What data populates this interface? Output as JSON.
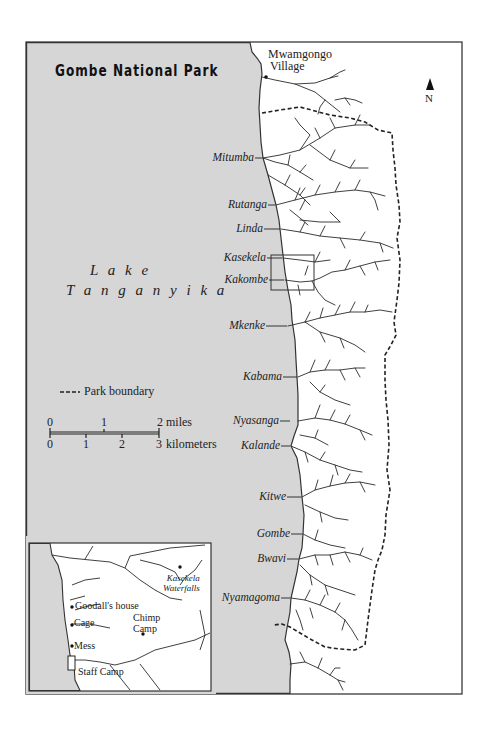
{
  "title": "Gombe National Park",
  "colors": {
    "lake": "#d6d6d6",
    "land": "#ffffff",
    "ink": "#222222",
    "frame": "#3a3a3a"
  },
  "north_arrow": {
    "icon": "north-arrow-icon",
    "label": "N"
  },
  "village": {
    "line1": "Mwamgongo",
    "line2": "Village"
  },
  "lake": {
    "line1": "L a k e",
    "line2": "T a n g a n y i k a"
  },
  "places": [
    {
      "name": "Mitumba",
      "y": 158
    },
    {
      "name": "Rutanga",
      "y": 205
    },
    {
      "name": "Linda",
      "y": 229
    },
    {
      "name": "Kasekela",
      "y": 258
    },
    {
      "name": "Kakombe",
      "y": 280
    },
    {
      "name": "Mkenke",
      "y": 326
    },
    {
      "name": "Kabama",
      "y": 377
    },
    {
      "name": "Nyasanga",
      "y": 421
    },
    {
      "name": "Kalande",
      "y": 446
    },
    {
      "name": "Kitwe",
      "y": 497
    },
    {
      "name": "Gombe",
      "y": 534
    },
    {
      "name": "Bwavi",
      "y": 559
    },
    {
      "name": "Nyamagoma",
      "y": 598
    }
  ],
  "legend": {
    "boundary_symbol": "---",
    "boundary_label": "Park boundary"
  },
  "scale": {
    "miles_ticks": [
      "0",
      "1",
      "2"
    ],
    "miles_unit": "miles",
    "km_ticks": [
      "0",
      "1",
      "2",
      "3"
    ],
    "km_unit": "kilometers"
  },
  "inset": {
    "goodall": "Goodall's house",
    "cage": "Cage",
    "mess": "Mess",
    "staff": "Staff Camp",
    "chimp1": "Chimp",
    "chimp2": "Camp",
    "falls1": "Kasekela",
    "falls2": "Waterfalls"
  }
}
